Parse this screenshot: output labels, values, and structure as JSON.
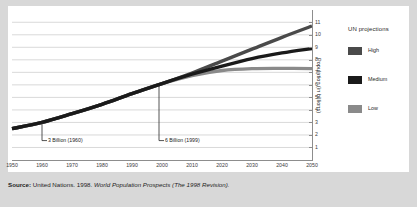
{
  "chart_data": {
    "type": "line",
    "title": "",
    "xlabel": "",
    "ylabel": "Population (in billions)",
    "xlim": [
      1950,
      2050
    ],
    "ylim": [
      0,
      11.5
    ],
    "grid": true,
    "legend_position": "right",
    "legend_title": "UN projections",
    "x_ticks": [
      "1950",
      "1960",
      "1970",
      "1980",
      "1990",
      "2000",
      "2010",
      "2020",
      "2030",
      "2040",
      "2050"
    ],
    "y_ticks": [
      "1",
      "2",
      "3",
      "4",
      "5",
      "6",
      "7",
      "8",
      "9",
      "10",
      "11"
    ],
    "x": [
      1950,
      1960,
      1970,
      1980,
      1990,
      2000,
      2010,
      2020,
      2030,
      2040,
      2050
    ],
    "series": [
      {
        "name": "High",
        "color": "#4a4a4a",
        "values": [
          2.5,
          3.0,
          3.7,
          4.45,
          5.3,
          6.1,
          6.95,
          7.9,
          8.85,
          9.8,
          10.7
        ]
      },
      {
        "name": "Medium",
        "color": "#1a1a1a",
        "values": [
          2.5,
          3.0,
          3.7,
          4.45,
          5.3,
          6.1,
          6.85,
          7.5,
          8.1,
          8.55,
          8.9
        ]
      },
      {
        "name": "Low",
        "color": "#8a8a8a",
        "values": [
          2.5,
          3.0,
          3.7,
          4.45,
          5.3,
          6.1,
          6.75,
          7.15,
          7.3,
          7.32,
          7.3
        ]
      }
    ],
    "annotations": [
      {
        "label": "3 Billion (1960)",
        "x": 1960,
        "y": 3.0
      },
      {
        "label": "6 Billion (1999)",
        "x": 1999,
        "y": 6.0
      }
    ]
  },
  "legend": {
    "title": "UN projections",
    "items": [
      {
        "label": "High",
        "color": "#4a4a4a"
      },
      {
        "label": "Medium",
        "color": "#1a1a1a"
      },
      {
        "label": "Low",
        "color": "#8a8a8a"
      }
    ]
  },
  "source": {
    "lead": "Source:",
    "text": " United Nations. 1998. ",
    "italic": "World Population Prospects (The 1998 Revision).",
    "full": "Source: United Nations. 1998. World Population Prospects (The 1998 Revision)."
  },
  "colors": {
    "page_background": "#d8d8d8",
    "card_background": "#ffffff",
    "grid": "#c9c9c9",
    "axis": "#8d8d8d",
    "text": "#2a2a2a"
  }
}
